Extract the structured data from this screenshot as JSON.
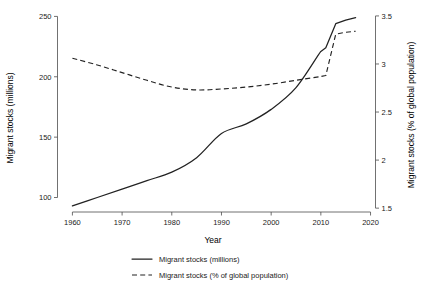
{
  "chart_data": {
    "type": "line",
    "title": "",
    "xlabel": "Year",
    "ylabel": "Migrant stocks (millions)",
    "y2label": "Migrant stocks (% of global population)",
    "xlim": [
      1957,
      2021
    ],
    "ylim": [
      88,
      252
    ],
    "y2lim": [
      1.46,
      3.52
    ],
    "xticks": [
      1960,
      1970,
      1980,
      1990,
      2000,
      2010,
      2020
    ],
    "xtick_labels": [
      "1960",
      "1970",
      "1980",
      "1990",
      "2000",
      "2010",
      "2020"
    ],
    "yticks": [
      100,
      150,
      200,
      250
    ],
    "ytick_labels": [
      "100",
      "150",
      "200",
      "250"
    ],
    "y2ticks": [
      1.5,
      2,
      2.5,
      3,
      3.5
    ],
    "y2tick_labels": [
      "1.5",
      "2",
      "2.5",
      "3",
      "3.5"
    ],
    "grid": false,
    "legend_position": "bottom",
    "series": [
      {
        "name": "Migrant stocks (millions)",
        "axis": "left",
        "style": "solid",
        "color": "#222222",
        "x": [
          1960,
          1965,
          1970,
          1975,
          1980,
          1985,
          1990,
          1995,
          2000,
          2005,
          2010,
          2011,
          2013,
          2015,
          2017
        ],
        "values": [
          93,
          100,
          107,
          114,
          121,
          133,
          153,
          161,
          173,
          191,
          221,
          224,
          244,
          247,
          249
        ]
      },
      {
        "name": "Migrant stocks (% of global population)",
        "axis": "right",
        "style": "dashed",
        "color": "#222222",
        "x": [
          1960,
          1965,
          1970,
          1975,
          1980,
          1985,
          1990,
          1995,
          2000,
          2005,
          2010,
          2011,
          2013,
          2015,
          2017
        ],
        "values": [
          3.06,
          2.99,
          2.91,
          2.83,
          2.76,
          2.73,
          2.74,
          2.76,
          2.79,
          2.83,
          2.87,
          2.88,
          3.31,
          3.33,
          3.34
        ]
      }
    ],
    "legend": [
      {
        "label": "Migrant stocks (millions)",
        "style": "solid"
      },
      {
        "label": "Migrant stocks (% of global population)",
        "style": "dashed"
      }
    ]
  }
}
